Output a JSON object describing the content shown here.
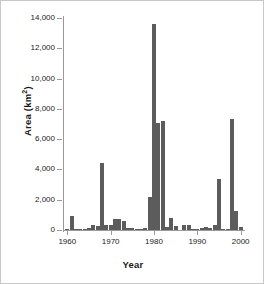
{
  "chart_data": {
    "type": "bar",
    "title": "",
    "xlabel": "Year",
    "ylabel": "Area (km 2)",
    "ylabel_text": "Area (km",
    "ylabel_sup": "2",
    "ylabel_tail": ")",
    "xlim": [
      1959,
      2001
    ],
    "ylim": [
      0,
      14000
    ],
    "grid": false,
    "legend": null,
    "bar_color": "#5c5c5c",
    "axis_color": "#9a9a9a",
    "text_color": "#1a1a1a",
    "background": "#ffffff",
    "ytick_labels": [
      "0",
      "2,000",
      "4,000",
      "6,000",
      "8,000",
      "10,000",
      "12,000",
      "14,000"
    ],
    "ytick_values": [
      0,
      2000,
      4000,
      6000,
      8000,
      10000,
      12000,
      14000
    ],
    "xtick_labels": [
      "1960",
      "1970",
      "1980",
      "1990",
      "2000"
    ],
    "xtick_values": [
      1960,
      1970,
      1980,
      1990,
      2000
    ],
    "x": [
      1960,
      1961,
      1962,
      1963,
      1964,
      1965,
      1966,
      1967,
      1968,
      1969,
      1970,
      1971,
      1972,
      1973,
      1974,
      1975,
      1976,
      1977,
      1978,
      1979,
      1980,
      1981,
      1982,
      1983,
      1984,
      1985,
      1986,
      1987,
      1988,
      1989,
      1990,
      1991,
      1992,
      1993,
      1994,
      1995,
      1996,
      1997,
      1998,
      1999,
      2000
    ],
    "values": [
      60,
      950,
      60,
      30,
      40,
      120,
      330,
      280,
      4400,
      330,
      350,
      700,
      720,
      620,
      150,
      110,
      90,
      100,
      130,
      2150,
      13600,
      7100,
      7200,
      200,
      790,
      250,
      0,
      330,
      330,
      100,
      90,
      120,
      180,
      150,
      330,
      3400,
      100,
      60,
      7350,
      1250,
      230
    ],
    "categories": [
      "1960",
      "1961",
      "1962",
      "1963",
      "1964",
      "1965",
      "1966",
      "1967",
      "1968",
      "1969",
      "1970",
      "1971",
      "1972",
      "1973",
      "1974",
      "1975",
      "1976",
      "1977",
      "1978",
      "1979",
      "1980",
      "1981",
      "1982",
      "1983",
      "1984",
      "1985",
      "1986",
      "1987",
      "1988",
      "1989",
      "1990",
      "1991",
      "1992",
      "1993",
      "1994",
      "1995",
      "1996",
      "1997",
      "1998",
      "1999",
      "2000"
    ]
  }
}
